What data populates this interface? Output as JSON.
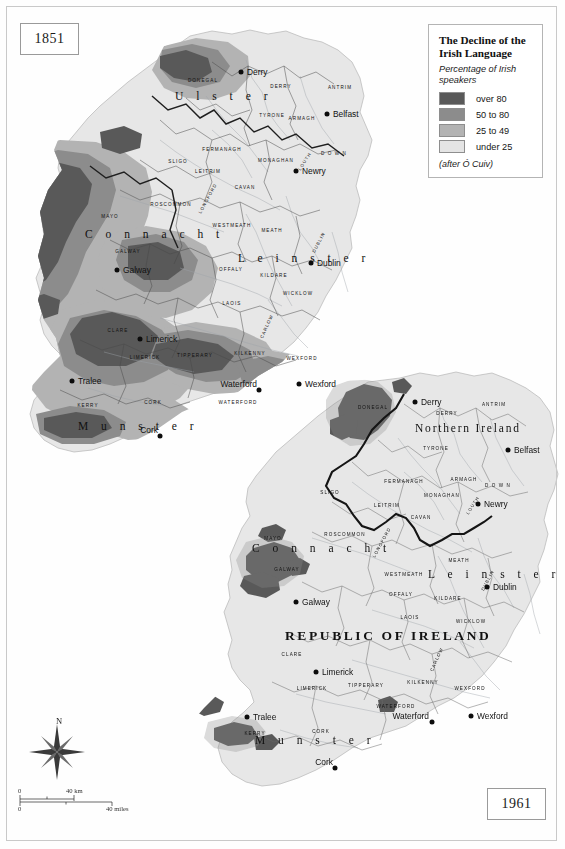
{
  "document": {
    "title": "The Decline of the Irish Language",
    "width": 565,
    "height": 849
  },
  "legend": {
    "title": "The Decline of the Irish Language",
    "subtitle": "Percentage of Irish speakers",
    "source": "(after Ó Cuiv)",
    "classes": [
      {
        "label": "over 80",
        "color": "#595959"
      },
      {
        "label": "50 to 80",
        "color": "#8c8c8c"
      },
      {
        "label": "25 to 49",
        "color": "#b3b3b3"
      },
      {
        "label": "under 25",
        "color": "#e4e4e4"
      }
    ]
  },
  "panels": {
    "top": {
      "year": "1851"
    },
    "bottom": {
      "year": "1961"
    }
  },
  "compass": {
    "north_label": "N"
  },
  "scalebar": {
    "km_zero": "0",
    "km_max": "40 km",
    "miles_zero": "0",
    "miles_max": "40 miles"
  },
  "map_1851": {
    "provinces": [
      "Ulster",
      "Connacht",
      "Leinster",
      "Munster"
    ],
    "counties": [
      "DONEGAL",
      "DERRY",
      "ANTRIM",
      "TYRONE",
      "FERMANAGH",
      "ARMAGH",
      "DOWN",
      "MONAGHAN",
      "CAVAN",
      "LEITRIM",
      "SLIGO",
      "ROSCOMMON",
      "LONGFORD",
      "MEATH",
      "LOUTH",
      "WESTMEATH",
      "OFFALY",
      "KILDARE",
      "DUBLIN",
      "LAOIS",
      "WICKLOW",
      "CARLOW",
      "KILKENNY",
      "WEXFORD",
      "TIPPERARY",
      "LIMERICK",
      "CLARE",
      "GALWAY",
      "MAYO",
      "KERRY",
      "CORK",
      "WATERFORD"
    ],
    "cities": [
      "Derry",
      "Belfast",
      "Newry",
      "Dublin",
      "Galway",
      "Limerick",
      "Tralee",
      "Waterford",
      "Wexford",
      "Cork"
    ]
  },
  "map_1961": {
    "states": [
      "Northern Ireland",
      "REPUBLIC OF IRELAND"
    ],
    "provinces": [
      "Connacht",
      "Leinster",
      "Munster"
    ],
    "counties": [
      "DONEGAL",
      "DERRY",
      "ANTRIM",
      "TYRONE",
      "FERMANAGH",
      "ARMAGH",
      "DOWN",
      "MONAGHAN",
      "CAVAN",
      "LEITRIM",
      "SLIGO",
      "ROSCOMMON",
      "LONGFORD",
      "MEATH",
      "LOUTH",
      "WESTMEATH",
      "OFFALY",
      "KILDARE",
      "DUBLIN",
      "LAOIS",
      "WICKLOW",
      "CARLOW",
      "KILKENNY",
      "WEXFORD",
      "TIPPERARY",
      "LIMERICK",
      "CLARE",
      "GALWAY",
      "MAYO",
      "KERRY",
      "CORK",
      "WATERFORD"
    ],
    "cities": [
      "Derry",
      "Belfast",
      "Newry",
      "Dublin",
      "Galway",
      "Limerick",
      "Tralee",
      "Waterford",
      "Wexford",
      "Cork"
    ]
  }
}
